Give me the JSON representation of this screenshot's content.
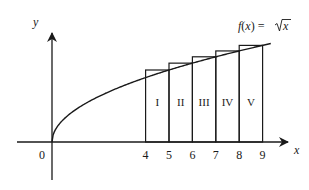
{
  "figure": {
    "function_label": "f(x) = √x",
    "function_label_parts": {
      "f": "f",
      "open": "(",
      "x": "x",
      "close": ") = ",
      "radical": "√",
      "arg": "x"
    },
    "axis_x_label": "x",
    "axis_y_label": "y",
    "origin_label": "0",
    "tick_labels": [
      "4",
      "5",
      "6",
      "7",
      "8",
      "9"
    ],
    "rect_labels": [
      "I",
      "II",
      "III",
      "IV",
      "V"
    ],
    "line_color": "#1a1a1a"
  },
  "chart_data": {
    "type": "line",
    "xlabel": "x",
    "ylabel": "y",
    "series": [
      {
        "name": "f(x) = √x",
        "x": [
          0,
          1,
          2,
          3,
          4,
          5,
          6,
          7,
          8,
          9
        ],
        "values": [
          0,
          1,
          1.414,
          1.732,
          2,
          2.236,
          2.449,
          2.646,
          2.828,
          3
        ]
      }
    ],
    "rectangles": [
      {
        "label": "I",
        "x_start": 4,
        "x_end": 5,
        "height": 2.236
      },
      {
        "label": "II",
        "x_start": 5,
        "x_end": 6,
        "height": 2.449
      },
      {
        "label": "III",
        "x_start": 6,
        "x_end": 7,
        "height": 2.646
      },
      {
        "label": "IV",
        "x_start": 7,
        "x_end": 8,
        "height": 2.828
      },
      {
        "label": "V",
        "x_start": 8,
        "x_end": 9,
        "height": 3.0
      }
    ],
    "x_ticks": [
      0,
      4,
      5,
      6,
      7,
      8,
      9
    ],
    "grid": false
  }
}
